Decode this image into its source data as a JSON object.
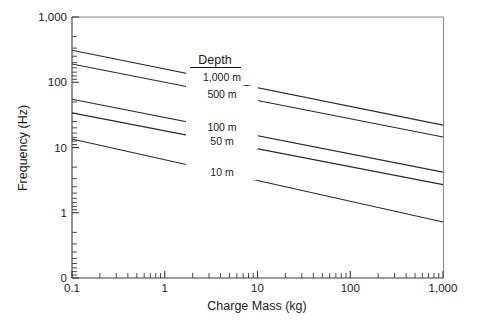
{
  "chart_data": {
    "type": "line",
    "title": "",
    "xlabel": "Charge Mass (kg)",
    "ylabel": "Frequency (Hz)",
    "xscale": "log",
    "yscale": "log",
    "xlim": [
      0.1,
      1000
    ],
    "ylim": [
      0.1,
      1000
    ],
    "grid": false,
    "legend_position": "inside-plot-right-of-lines",
    "legend_title": "Depth",
    "x_tick_labels": [
      "0.1",
      "1",
      "10",
      "100",
      "1,000"
    ],
    "x_tick_values": [
      0.1,
      1,
      10,
      100,
      1000
    ],
    "y_tick_labels": [
      "0",
      "1",
      "10",
      "100",
      "1,000"
    ],
    "y_tick_values": [
      0.1,
      1,
      10,
      100,
      1000
    ],
    "y_axis_origin_label": "0",
    "series": [
      {
        "name": "1,000 m",
        "label": "1,000 m",
        "x": [
          0.1,
          1000
        ],
        "values": [
          310,
          22.0
        ],
        "color": "#2b2b2b"
      },
      {
        "name": "500 m",
        "label": "500 m",
        "x": [
          0.1,
          1000
        ],
        "values": [
          190,
          14.5
        ],
        "color": "#2b2b2b"
      },
      {
        "name": "100 m",
        "label": "100 m",
        "x": [
          0.1,
          1000
        ],
        "values": [
          55,
          4.2
        ],
        "color": "#2b2b2b"
      },
      {
        "name": "50 m",
        "label": "50 m",
        "x": [
          0.1,
          1000
        ],
        "values": [
          34,
          2.7
        ],
        "color": "#2b2b2b"
      },
      {
        "name": "10 m",
        "label": "10 m",
        "x": [
          0.1,
          1000
        ],
        "values": [
          13.5,
          0.72
        ],
        "color": "#2b2b2b"
      }
    ]
  },
  "geometry": {
    "plot_left": 72,
    "plot_right": 443,
    "plot_top": 17,
    "plot_bottom": 278,
    "decade_px_x": 92.75,
    "decade_px_y": 65.25
  },
  "labels": {
    "y_axis_title": "Frequency (Hz)",
    "x_axis_title": "Charge Mass (kg)",
    "legend_header": "Depth"
  }
}
